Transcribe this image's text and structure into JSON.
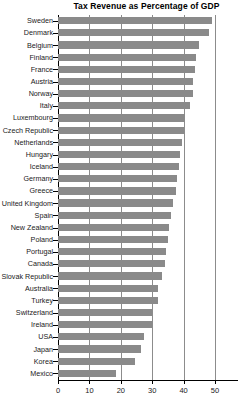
{
  "chart_data": {
    "type": "bar",
    "orientation": "horizontal",
    "title": "Tax Revenue as Percentage of GDP",
    "xlabel": "",
    "ylabel": "",
    "xlim": [
      0,
      53
    ],
    "ylim": null,
    "grid": true,
    "grid_axis": "x",
    "legend": false,
    "legend_position": "none",
    "bar_color": "#8a8a8a",
    "axis_color": "#000000",
    "grid_color": "#8c8c8c",
    "xticks": [
      0,
      10,
      20,
      30,
      40,
      50
    ],
    "xticklabels": [
      "0",
      "10",
      "20",
      "30",
      "40",
      "50"
    ],
    "categories": [
      "Sweden",
      "Denmark",
      "Belgium",
      "Finland",
      "France",
      "Austria",
      "Norway",
      "Italy",
      "Luxembourg",
      "Czech Republic",
      "Netherlands",
      "Hungary",
      "Iceland",
      "Germany",
      "Greece",
      "United Kingdom",
      "Spain",
      "New Zealand",
      "Poland",
      "Portugal",
      "Canada",
      "Slovak Republic",
      "Australia",
      "Turkey",
      "Switzerland",
      "Ireland",
      "USA",
      "Japan",
      "Korea",
      "Mexico"
    ],
    "values": [
      49.0,
      48.0,
      45.0,
      44.0,
      43.5,
      43.0,
      43.0,
      42.0,
      40.5,
      40.0,
      39.5,
      39.0,
      38.5,
      38.0,
      37.5,
      36.5,
      36.0,
      35.5,
      35.0,
      34.5,
      34.0,
      33.0,
      32.0,
      32.0,
      30.0,
      30.0,
      27.5,
      26.5,
      24.5,
      18.5
    ]
  }
}
